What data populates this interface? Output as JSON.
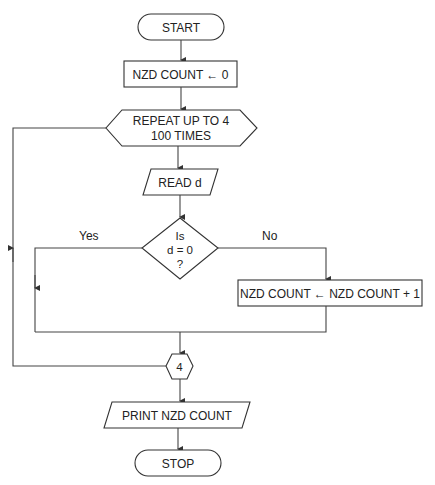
{
  "diagram": {
    "type": "flowchart",
    "nodes": {
      "start": "START",
      "init": "NZD COUNT ← 0",
      "loop_line1": "REPEAT UP TO 4",
      "loop_line2": "100 TIMES",
      "read": "READ d",
      "decision_line1": "Is",
      "decision_line2": "d = 0",
      "decision_line3": "?",
      "increment": "NZD COUNT ← NZD COUNT + 1",
      "connector": "4",
      "print": "PRINT NZD COUNT",
      "stop": "STOP"
    },
    "labels": {
      "yes": "Yes",
      "no": "No"
    },
    "colors": {
      "stroke": "#333333",
      "fill": "#ffffff",
      "text": "#222222"
    }
  }
}
